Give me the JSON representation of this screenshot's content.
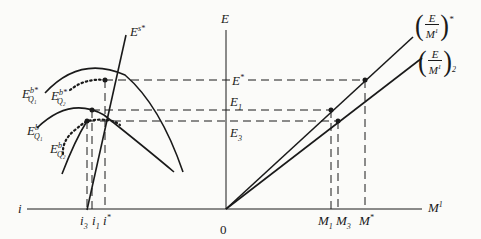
{
  "diagram": {
    "axes": {
      "vertical_label": "E",
      "horizontal_right_label": "M",
      "horizontal_right_label_sup": "1",
      "horizontal_left_label": "i",
      "origin_label": "0"
    },
    "supply_curve": {
      "label": "E",
      "label_sup": "s*"
    },
    "demand_curves": [
      {
        "label": "E",
        "sup": "b*",
        "sub": "Q₁",
        "style": "solid"
      },
      {
        "label": "E",
        "sup": "b*",
        "sub": "Q₂",
        "style": "dotted"
      },
      {
        "label": "E",
        "sup": "b",
        "sub": "Q₁",
        "style": "solid"
      },
      {
        "label": "E",
        "sup": "b",
        "sub": "Q₂",
        "style": "dotted"
      }
    ],
    "E_levels": [
      {
        "label": "E",
        "sub": "",
        "sup": "*"
      },
      {
        "label": "E",
        "sub": "1",
        "sup": ""
      },
      {
        "label": "E",
        "sub": "3",
        "sup": ""
      }
    ],
    "i_ticks": [
      {
        "label": "i",
        "sub": "3",
        "sup": ""
      },
      {
        "label": "i",
        "sub": "1",
        "sup": ""
      },
      {
        "label": "i",
        "sub": "",
        "sup": "*"
      }
    ],
    "M_ticks": [
      {
        "label": "M",
        "sub": "1",
        "sup": ""
      },
      {
        "label": "M",
        "sub": "3",
        "sup": ""
      },
      {
        "label": "M",
        "sub": "",
        "sup": "*"
      }
    ],
    "rays": [
      {
        "num": "E",
        "den": "M",
        "den_sup": "1",
        "suffix_sup": "*",
        "suffix_sub": ""
      },
      {
        "num": "E",
        "den": "M",
        "den_sup": "1",
        "suffix_sup": "",
        "suffix_sub": "2"
      }
    ]
  }
}
